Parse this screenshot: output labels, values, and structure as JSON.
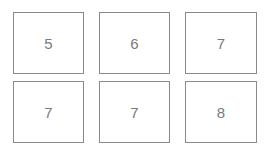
{
  "grid": {
    "cells": [
      {
        "value": "5"
      },
      {
        "value": "6"
      },
      {
        "value": "7"
      },
      {
        "value": "7"
      },
      {
        "value": "7"
      },
      {
        "value": "8"
      }
    ]
  }
}
